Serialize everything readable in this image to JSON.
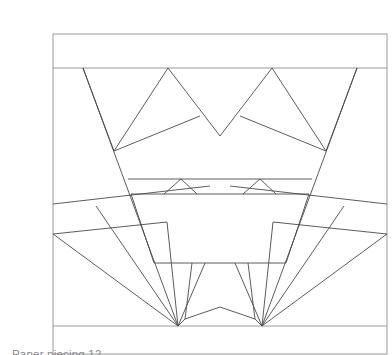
{
  "document": {
    "kind": "line-drawing",
    "subject": "foundation-pieced quilt block diagram",
    "background_color": "#ffffff"
  },
  "caption": {
    "text": "Paper piecing 12"
  },
  "figure": {
    "name": "quilt-block-pattern",
    "stroke_color": "#4a4a4a",
    "border_color": "#9a9a9a",
    "fill_color": "#ffffff",
    "stroke_width": 0.9,
    "border_width": 1.0,
    "viewbox": "0 0 360 355"
  },
  "chart_data": {
    "type": "diagram",
    "title": "Paper piecing 12",
    "xlabel": "",
    "ylabel": "",
    "grid": false,
    "legend": null,
    "xlim": [
      0,
      360
    ],
    "ylim": [
      0,
      355
    ],
    "frame": {
      "name": "outer-frame",
      "x": 13,
      "y": 18,
      "width": 334,
      "height": 320
    },
    "bands": [
      {
        "name": "top-border-band",
        "y_top": 18,
        "y_bottom": 52
      },
      {
        "name": "bottom-border-band",
        "y_top": 310,
        "y_bottom": 338
      }
    ],
    "polylines": [
      {
        "name": "top-band-divider",
        "points": [
          [
            13,
            52
          ],
          [
            347,
            52
          ]
        ]
      },
      {
        "name": "bottom-band-divider",
        "points": [
          [
            13,
            310
          ],
          [
            347,
            310
          ]
        ]
      },
      {
        "name": "left-outer-stem",
        "points": [
          [
            43,
            52
          ],
          [
            138,
            310
          ]
        ]
      },
      {
        "name": "right-outer-stem",
        "points": [
          [
            317,
            52
          ],
          [
            222,
            310
          ]
        ]
      },
      {
        "name": "left-petal-inner",
        "points": [
          [
            43,
            52
          ],
          [
            74,
            135
          ]
        ]
      },
      {
        "name": "right-petal-inner",
        "points": [
          [
            317,
            52
          ],
          [
            286,
            135
          ]
        ]
      },
      {
        "name": "left-zigzag",
        "points": [
          [
            74,
            135
          ],
          [
            128,
            52
          ],
          [
            180,
            120
          ],
          [
            232,
            52
          ],
          [
            286,
            135
          ]
        ]
      },
      {
        "name": "left-shoulder",
        "points": [
          [
            74,
            135
          ],
          [
            160,
            100
          ]
        ]
      },
      {
        "name": "right-shoulder",
        "points": [
          [
            286,
            135
          ],
          [
            200,
            100
          ]
        ]
      },
      {
        "name": "basket-top-line",
        "points": [
          [
            88,
            163
          ],
          [
            272,
            163
          ]
        ]
      },
      {
        "name": "basket-second-line",
        "points": [
          [
            91,
            178
          ],
          [
            269,
            178
          ]
        ]
      },
      {
        "name": "small-triangle-left",
        "points": [
          [
            124,
            178
          ],
          [
            141,
            163
          ],
          [
            157,
            178
          ]
        ]
      },
      {
        "name": "small-triangle-right",
        "points": [
          [
            203,
            178
          ],
          [
            220,
            163
          ],
          [
            236,
            178
          ]
        ]
      },
      {
        "name": "basket-left-side",
        "points": [
          [
            91,
            178
          ],
          [
            114,
            247
          ]
        ]
      },
      {
        "name": "basket-right-side",
        "points": [
          [
            269,
            178
          ],
          [
            246,
            247
          ]
        ]
      },
      {
        "name": "basket-bottom-line",
        "points": [
          [
            114,
            247
          ],
          [
            246,
            247
          ]
        ]
      },
      {
        "name": "stem-left-edge",
        "points": [
          [
            152,
            247
          ],
          [
            145,
            303
          ]
        ]
      },
      {
        "name": "stem-right-edge",
        "points": [
          [
            208,
            247
          ],
          [
            215,
            303
          ]
        ]
      },
      {
        "name": "stem-notch",
        "points": [
          [
            145,
            303
          ],
          [
            180,
            291
          ],
          [
            215,
            303
          ]
        ]
      },
      {
        "name": "stem-foot-left",
        "points": [
          [
            145,
            303
          ],
          [
            138,
            310
          ]
        ]
      },
      {
        "name": "stem-foot-right",
        "points": [
          [
            215,
            303
          ],
          [
            222,
            310
          ]
        ]
      },
      {
        "name": "inner-foot-left",
        "points": [
          [
            138,
            310
          ],
          [
            165,
            247
          ]
        ]
      },
      {
        "name": "inner-foot-right",
        "points": [
          [
            222,
            310
          ],
          [
            195,
            247
          ]
        ]
      },
      {
        "name": "left-fan-upper-band",
        "points": [
          [
            13,
            188
          ],
          [
            170,
            170
          ]
        ]
      },
      {
        "name": "left-fan-lower-band",
        "points": [
          [
            13,
            218
          ],
          [
            127,
            206
          ]
        ]
      },
      {
        "name": "left-fan-ray-1",
        "points": [
          [
            13,
            218
          ],
          [
            138,
            310
          ]
        ]
      },
      {
        "name": "left-fan-ray-2",
        "points": [
          [
            56,
            190
          ],
          [
            138,
            310
          ]
        ]
      },
      {
        "name": "left-fan-ray-3",
        "points": [
          [
            127,
            206
          ],
          [
            138,
            310
          ]
        ]
      },
      {
        "name": "right-fan-upper-band",
        "points": [
          [
            347,
            188
          ],
          [
            190,
            170
          ]
        ]
      },
      {
        "name": "right-fan-lower-band",
        "points": [
          [
            347,
            218
          ],
          [
            233,
            206
          ]
        ]
      },
      {
        "name": "right-fan-ray-1",
        "points": [
          [
            347,
            218
          ],
          [
            222,
            310
          ]
        ]
      },
      {
        "name": "right-fan-ray-2",
        "points": [
          [
            304,
            190
          ],
          [
            222,
            310
          ]
        ]
      },
      {
        "name": "right-fan-ray-3",
        "points": [
          [
            233,
            206
          ],
          [
            222,
            310
          ]
        ]
      }
    ],
    "vertices_of_interest": [
      {
        "name": "left-shoulder-node",
        "x": 74,
        "y": 135
      },
      {
        "name": "right-shoulder-node",
        "x": 286,
        "y": 135
      },
      {
        "name": "left-fan-apex",
        "x": 138,
        "y": 310
      },
      {
        "name": "right-fan-apex",
        "x": 222,
        "y": 310
      },
      {
        "name": "center-valley",
        "x": 180,
        "y": 120
      }
    ]
  }
}
